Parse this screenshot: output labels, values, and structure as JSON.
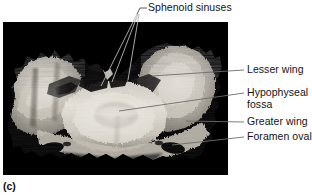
{
  "figure": {
    "letter": "(c)",
    "caption_letter_bold": true,
    "specimen": "sphenoid bone, superior view",
    "photo_background_color": "#050505",
    "text_color": "#141414",
    "leader_line_color": "#6d6d6d"
  },
  "labels": {
    "sphenoid_sinuses": "Sphenoid sinuses",
    "lesser_wing": "Lesser wing",
    "hypophyseal_fossa_line1": "Hypophyseal",
    "hypophyseal_fossa_line2": "fossa",
    "greater_wing": "Greater wing",
    "foramen_ovale": "Foramen ovale"
  },
  "annotations": [
    {
      "id": "sphenoid-sinuses",
      "text": "Sphenoid sinuses",
      "position": "top",
      "leader_count": 3,
      "targets": [
        "left sinus opening",
        "middle sinus opening",
        "right sinus opening"
      ]
    },
    {
      "id": "lesser-wing",
      "text": "Lesser wing",
      "position": "right",
      "leader_count": 1
    },
    {
      "id": "hypophyseal-fossa",
      "text": "Hypophyseal fossa",
      "position": "right",
      "leader_count": 1
    },
    {
      "id": "greater-wing",
      "text": "Greater wing",
      "position": "right",
      "leader_count": 1
    },
    {
      "id": "foramen-ovale",
      "text": "Foramen ovale",
      "position": "right",
      "leader_count": 1
    }
  ]
}
